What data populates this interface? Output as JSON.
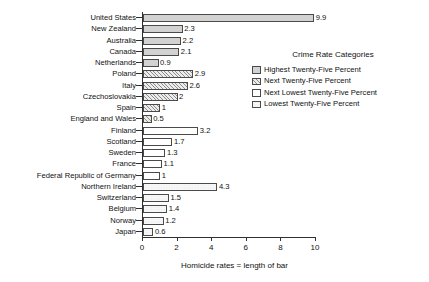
{
  "chart_data": {
    "type": "bar",
    "orientation": "horizontal",
    "title": "",
    "xlabel": "Homicide rates = length of bar",
    "ylabel": "",
    "xlim": [
      0,
      10
    ],
    "xticks": [
      0,
      2,
      4,
      6,
      8,
      10
    ],
    "grid": false,
    "categories": [
      "United States",
      "New Zealand",
      "Australia",
      "Canada",
      "Netherlands",
      "Poland",
      "Italy",
      "Czechoslovakia",
      "Spain",
      "England and Wales",
      "Finland",
      "Scotland",
      "Sweden",
      "France",
      "Federal Republic of Germany",
      "Northern Ireland",
      "Switzerland",
      "Belgium",
      "Norway",
      "Japan"
    ],
    "values": [
      9.9,
      2.3,
      2.2,
      2.1,
      0.9,
      2.9,
      2.6,
      2,
      1,
      0.5,
      3.2,
      1.7,
      1.3,
      1.1,
      1,
      4.3,
      1.5,
      1.4,
      1.2,
      0.6
    ],
    "value_labels": [
      "9.9",
      "2.3",
      "2.2",
      "2.1",
      "0.9",
      "2.9",
      "2.6",
      "2",
      "1",
      "0.5",
      "3.2",
      "1.7",
      "1.3",
      "1.1",
      "1",
      "4.3",
      "1.5",
      "1.4",
      "1.2",
      "0.6"
    ],
    "bar_patterns": [
      "solid-gray",
      "solid-gray",
      "solid-gray",
      "solid-gray",
      "solid-gray",
      "hatch",
      "hatch",
      "hatch",
      "hatch",
      "hatch",
      "empty",
      "empty",
      "empty",
      "empty",
      "empty",
      "checker",
      "checker",
      "checker",
      "checker",
      "checker"
    ],
    "legend": {
      "position": "right",
      "title": "Crime Rate Categories",
      "entries": [
        {
          "label": "Highest Twenty-Five Percent",
          "pattern": "solid-gray"
        },
        {
          "label": "Next Twenty-Five Percent",
          "pattern": "hatch"
        },
        {
          "label": "Next Lowest Twenty-Five Percent",
          "pattern": "empty"
        },
        {
          "label": "Lowest Twenty-Five Percent",
          "pattern": "checker"
        }
      ]
    },
    "colors": {
      "solid_gray_fill": "#d2d2d2",
      "hatch_fill": "#ececed",
      "hatch_line": "#8d8d8d",
      "empty_fill": "#ffffff",
      "checker_dark": "#4a4a4a",
      "checker_light": "#f2f2f2",
      "bar_outline": "#4a4a4a",
      "axis": "#303030",
      "text": "#111111",
      "background": "#ffffff"
    }
  }
}
